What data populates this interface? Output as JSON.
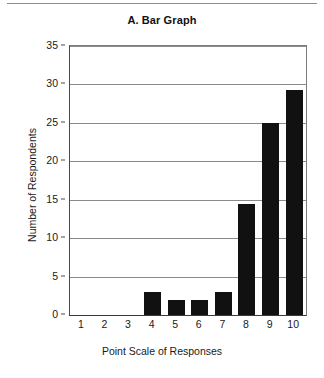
{
  "figure": {
    "top_rule": true,
    "background": "#ffffff",
    "bar_color": "#111111",
    "gridline_color": "#8a8a8a",
    "axis_color": "#3a3a3a"
  },
  "chart_data": {
    "type": "bar",
    "title": "A. Bar Graph",
    "xlabel": "Point Scale of Responses",
    "ylabel": "Number of Respondents",
    "categories": [
      "1",
      "2",
      "3",
      "4",
      "5",
      "6",
      "7",
      "8",
      "9",
      "10"
    ],
    "values": [
      0,
      0,
      0,
      3,
      2,
      2,
      3,
      14.4,
      25,
      29.3
    ],
    "ylim": [
      0,
      35
    ],
    "yticks": [
      0,
      5,
      10,
      15,
      20,
      25,
      30,
      35
    ],
    "ytick_labels": [
      "0",
      "5",
      "10",
      "15",
      "20",
      "25",
      "30",
      "35"
    ],
    "grid": true,
    "grid_axis": "y",
    "legend": false,
    "series": [
      {
        "name": "Number of Respondents",
        "values": [
          0,
          0,
          0,
          3,
          2,
          2,
          3,
          14.4,
          25,
          29.3
        ]
      }
    ]
  }
}
